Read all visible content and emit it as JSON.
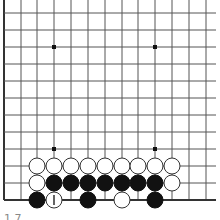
{
  "board": {
    "size_visible": {
      "cols": 13,
      "rows": 12
    },
    "edges": {
      "left": true,
      "bottom": true,
      "top": false,
      "right": false
    },
    "grid": {
      "x": [
        4,
        21,
        37,
        54,
        71,
        88,
        105,
        122,
        138,
        155,
        172,
        189,
        206
      ],
      "y": [
        13,
        30,
        47,
        64,
        81,
        98,
        115,
        132,
        149,
        166,
        183,
        200
      ],
      "line_extend_right": 216,
      "line_extend_top": 0
    },
    "colors": {
      "background": "#ffffff",
      "line": "#555555",
      "edge": "#333333",
      "black_stone": "#111111",
      "white_stone": "#ffffff",
      "white_stone_outline": "#333333",
      "star": "#111111"
    },
    "star_points": [
      {
        "col": 3,
        "row": 2
      },
      {
        "col": 9,
        "row": 2
      },
      {
        "col": 3,
        "row": 8
      },
      {
        "col": 9,
        "row": 8
      }
    ],
    "stones": [
      {
        "col": 2,
        "row": 9,
        "color": "white"
      },
      {
        "col": 3,
        "row": 9,
        "color": "white"
      },
      {
        "col": 4,
        "row": 9,
        "color": "white"
      },
      {
        "col": 5,
        "row": 9,
        "color": "white"
      },
      {
        "col": 6,
        "row": 9,
        "color": "white"
      },
      {
        "col": 7,
        "row": 9,
        "color": "white"
      },
      {
        "col": 8,
        "row": 9,
        "color": "white"
      },
      {
        "col": 9,
        "row": 9,
        "color": "white"
      },
      {
        "col": 10,
        "row": 9,
        "color": "white"
      },
      {
        "col": 2,
        "row": 10,
        "color": "white"
      },
      {
        "col": 3,
        "row": 10,
        "color": "black"
      },
      {
        "col": 4,
        "row": 10,
        "color": "black"
      },
      {
        "col": 5,
        "row": 10,
        "color": "black"
      },
      {
        "col": 6,
        "row": 10,
        "color": "black"
      },
      {
        "col": 7,
        "row": 10,
        "color": "black"
      },
      {
        "col": 8,
        "row": 10,
        "color": "black"
      },
      {
        "col": 9,
        "row": 10,
        "color": "black"
      },
      {
        "col": 10,
        "row": 10,
        "color": "white"
      },
      {
        "col": 2,
        "row": 11,
        "color": "black"
      },
      {
        "col": 3,
        "row": 11,
        "color": "white",
        "mark": "1"
      },
      {
        "col": 5,
        "row": 11,
        "color": "black"
      },
      {
        "col": 7,
        "row": 11,
        "color": "white"
      },
      {
        "col": 9,
        "row": 11,
        "color": "black"
      }
    ]
  },
  "caption": "1 7"
}
